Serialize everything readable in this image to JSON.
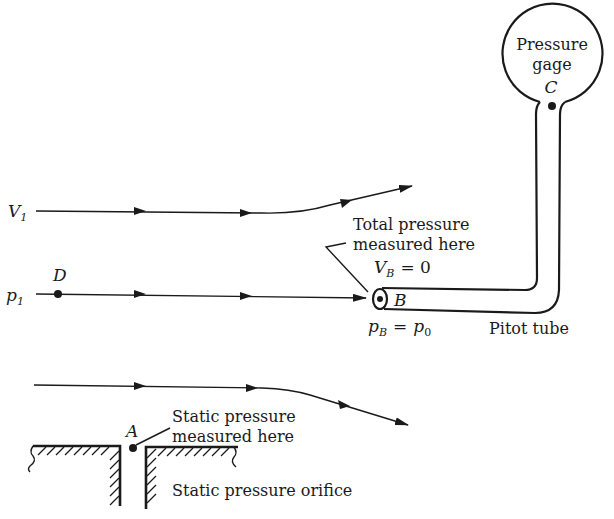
{
  "diagram": {
    "gauge": {
      "label_line1": "Pressure",
      "label_line2": "gage",
      "point": "C"
    },
    "streamlines": {
      "top_label": "V",
      "top_label_sub": "1",
      "middle_label": "p",
      "middle_label_sub": "1",
      "middle_point": "D"
    },
    "pitot": {
      "annotation_line1": "Total pressure",
      "annotation_line2": "measured here",
      "vb_symbol": "V",
      "vb_sub": "B",
      "vb_value": "= 0",
      "point": "B",
      "pb_symbol": "p",
      "pb_sub": "B",
      "pb_eq": "=",
      "p0_symbol": "p",
      "p0_sub": "0",
      "tube_label": "Pitot tube"
    },
    "static": {
      "point": "A",
      "annotation_line1": "Static pressure",
      "annotation_line2": "measured here",
      "orifice_label": "Static pressure orifice"
    },
    "colors": {
      "ink": "#1a1a1a",
      "background": "#ffffff"
    }
  }
}
